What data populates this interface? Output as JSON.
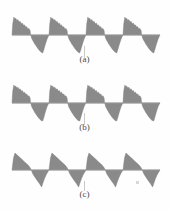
{
  "figure": {
    "background_color": "#fefefe",
    "wave_fill_color": "#8a8a8a",
    "wave_stroke_color": "#7a7a7a",
    "axis_color": "#9a9a9a",
    "label_color": "#4a4a4a",
    "panels": [
      {
        "id": "a",
        "label": "(a)",
        "texture": "jagged",
        "cycles": 4,
        "baseline_y": 27,
        "peak_amplitude": 18,
        "trough_amplitude": 18
      },
      {
        "id": "b",
        "label": "(b)",
        "texture": "jagged",
        "cycles": 4,
        "baseline_y": 27,
        "peak_amplitude": 18,
        "trough_amplitude": 18
      },
      {
        "id": "c",
        "label": "(c)",
        "texture": "smooth",
        "cycles": 4,
        "baseline_y": 27,
        "peak_amplitude": 17,
        "trough_amplitude": 17
      }
    ]
  },
  "chart_data": {
    "type": "line",
    "title": "",
    "subtitle": "",
    "xlabel": "",
    "ylabel": "",
    "grid": false,
    "legend_position": "none",
    "xlim": [
      0,
      4
    ],
    "ylim": [
      -1,
      1
    ],
    "panel_labels": [
      "(a)",
      "(b)",
      "(c)"
    ],
    "series": [
      {
        "name": "(a)",
        "texture": "jagged",
        "cycles": 4,
        "period": 1.0,
        "peak": 1.0,
        "trough": -1.0,
        "x": [
          0.0,
          0.02,
          0.05,
          0.08,
          0.1,
          0.13,
          0.16,
          0.19,
          0.22,
          0.25,
          0.28,
          0.31,
          0.34,
          0.37,
          0.4,
          0.43,
          0.46,
          0.49,
          0.5,
          0.53,
          0.56,
          0.59,
          0.62,
          0.65,
          0.68,
          0.71,
          0.74,
          0.77,
          0.8,
          0.83,
          0.86,
          0.89,
          0.92,
          0.95,
          0.98,
          1.0
        ],
        "values": [
          0.0,
          0.62,
          1.0,
          0.88,
          0.94,
          0.8,
          0.86,
          0.72,
          0.76,
          0.62,
          0.66,
          0.54,
          0.56,
          0.44,
          0.46,
          0.34,
          0.36,
          0.24,
          0.05,
          -0.18,
          -0.3,
          -0.4,
          -0.52,
          -0.6,
          -0.7,
          -0.78,
          -0.86,
          -0.92,
          -0.97,
          -1.0,
          -0.82,
          -0.6,
          -0.4,
          -0.22,
          -0.08,
          0.0
        ]
      },
      {
        "name": "(b)",
        "texture": "jagged",
        "cycles": 4,
        "period": 1.0,
        "peak": 1.0,
        "trough": -1.0,
        "x": [
          0.0,
          0.02,
          0.05,
          0.08,
          0.1,
          0.13,
          0.16,
          0.19,
          0.22,
          0.25,
          0.28,
          0.31,
          0.34,
          0.37,
          0.4,
          0.43,
          0.46,
          0.49,
          0.5,
          0.53,
          0.56,
          0.59,
          0.62,
          0.65,
          0.68,
          0.71,
          0.74,
          0.77,
          0.8,
          0.83,
          0.86,
          0.89,
          0.92,
          0.95,
          0.98,
          1.0
        ],
        "values": [
          0.0,
          0.66,
          1.0,
          0.9,
          0.95,
          0.83,
          0.88,
          0.75,
          0.79,
          0.66,
          0.69,
          0.57,
          0.6,
          0.48,
          0.5,
          0.38,
          0.4,
          0.27,
          0.06,
          -0.2,
          -0.32,
          -0.43,
          -0.54,
          -0.63,
          -0.72,
          -0.8,
          -0.88,
          -0.94,
          -0.98,
          -1.0,
          -0.8,
          -0.58,
          -0.38,
          -0.2,
          -0.07,
          0.0
        ]
      },
      {
        "name": "(c)",
        "texture": "smooth",
        "cycles": 4,
        "period": 1.0,
        "peak": 1.0,
        "trough": -1.0,
        "x": [
          0.0,
          0.04,
          0.08,
          0.14,
          0.2,
          0.26,
          0.32,
          0.38,
          0.44,
          0.5,
          0.56,
          0.62,
          0.68,
          0.74,
          0.8,
          0.84,
          0.88,
          0.92,
          0.96,
          1.0
        ],
        "values": [
          0.0,
          0.7,
          1.0,
          0.88,
          0.76,
          0.64,
          0.52,
          0.4,
          0.28,
          0.1,
          -0.22,
          -0.42,
          -0.62,
          -0.8,
          -1.0,
          -0.74,
          -0.5,
          -0.3,
          -0.14,
          0.0
        ]
      }
    ]
  }
}
